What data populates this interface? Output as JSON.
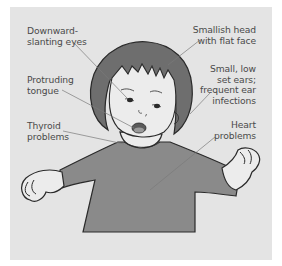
{
  "diagram": {
    "colors": {
      "panel_background": "#e4e4e4",
      "hair": "#6e6e6e",
      "shirt": "#8a8a8a",
      "skin": "#e9e9e9",
      "outline": "#2a2a2a",
      "leader_line": "#7a7a7a",
      "label_text": "#4a4a4a"
    },
    "labels": {
      "eyes": {
        "line1": "Downward-",
        "line2": "slanting eyes"
      },
      "tongue": {
        "line1": "Protruding",
        "line2": "tongue"
      },
      "thyroid": {
        "line1": "Thyroid",
        "line2": "problems"
      },
      "head": {
        "line1": "Smallish head",
        "line2": "with flat face"
      },
      "ears": {
        "line1": "Small, low",
        "line2": "set ears;",
        "line3": "frequent ear",
        "line4": "infections"
      },
      "heart": {
        "line1": "Heart",
        "line2": "problems"
      }
    }
  }
}
